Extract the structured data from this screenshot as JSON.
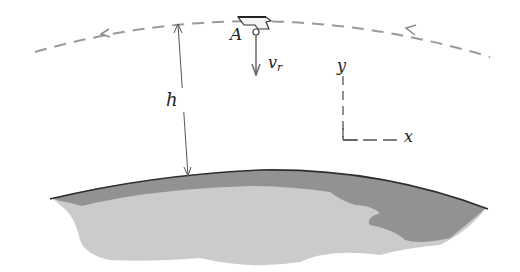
{
  "diagram": {
    "type": "orbital-mechanics-figure",
    "labels": {
      "point": "A",
      "altitude": "h",
      "velocity_main": "v",
      "velocity_sub": "r",
      "axis_y": "y",
      "axis_x": "x"
    },
    "elements": [
      {
        "name": "orbit-path",
        "style": "dashed",
        "direction": "right-to-left",
        "arrows": 2
      },
      {
        "name": "satellite",
        "label": "A"
      },
      {
        "name": "radial-velocity-vector",
        "label": "v_r",
        "direction": "down"
      },
      {
        "name": "altitude-dimension",
        "label": "h"
      },
      {
        "name": "coordinate-axes",
        "labels": [
          "x",
          "y"
        ]
      },
      {
        "name": "earth-surface"
      }
    ],
    "colors": {
      "orbit": "#9a9a9a",
      "line": "#555555",
      "earth_surface_line": "#333333",
      "earth_dark": "#8e8e8e",
      "earth_light": "#c9c9c9",
      "text": "#222222"
    }
  }
}
